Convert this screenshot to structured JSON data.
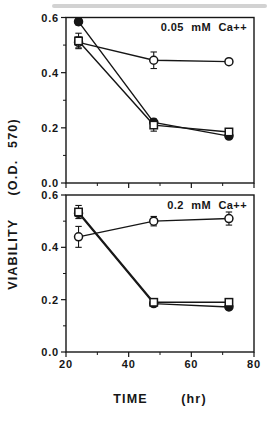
{
  "figure": {
    "background": "#ffffff",
    "ink": "#161616",
    "ylabel": "VIABILITY  (O.D. 570)",
    "xlabel": "TIME  (hr)"
  },
  "chart_data": [
    {
      "type": "line",
      "title": "0.05 mM Ca++",
      "xlabel_visible": false,
      "x": [
        24,
        48,
        72
      ],
      "xlim": [
        20,
        80
      ],
      "ylim": [
        0,
        0.6
      ],
      "yticks": [
        0,
        0.2,
        0.4,
        0.6
      ],
      "yticks_minor": [
        0.1,
        0.3,
        0.5
      ],
      "xticks": [
        20,
        40,
        60,
        80
      ],
      "xticks_minor": [
        30,
        50,
        70
      ],
      "series": [
        {
          "name": "open-circle",
          "marker": "circle",
          "filled": false,
          "values": [
            0.51,
            0.445,
            0.44
          ],
          "errors": [
            0.02,
            0.03,
            0.008
          ]
        },
        {
          "name": "filled-circle",
          "marker": "circle",
          "filled": true,
          "values": [
            0.585,
            0.22,
            0.17
          ],
          "errors": [
            0.012,
            0.008,
            0.008
          ]
        },
        {
          "name": "open-square",
          "marker": "square",
          "filled": false,
          "values": [
            0.515,
            0.21,
            0.185
          ],
          "errors": [
            0.028,
            0.022,
            0.008
          ]
        }
      ]
    },
    {
      "type": "line",
      "title": "0.2 mM Ca++",
      "xlabel_visible": true,
      "x": [
        24,
        48,
        72
      ],
      "xlim": [
        20,
        80
      ],
      "ylim": [
        0,
        0.6
      ],
      "yticks": [
        0,
        0.2,
        0.4,
        0.6
      ],
      "yticks_minor": [
        0.1,
        0.3,
        0.5
      ],
      "xticks": [
        20,
        40,
        60,
        80
      ],
      "xticks_minor": [
        30,
        50,
        70
      ],
      "series": [
        {
          "name": "open-circle",
          "marker": "circle",
          "filled": false,
          "values": [
            0.44,
            0.5,
            0.51
          ],
          "errors": [
            0.04,
            0.018,
            0.025
          ]
        },
        {
          "name": "filled-circle",
          "marker": "circle",
          "filled": true,
          "values": [
            0.53,
            0.185,
            0.172
          ],
          "errors": [
            0.01,
            0.006,
            0.006
          ]
        },
        {
          "name": "open-square",
          "marker": "square",
          "filled": false,
          "values": [
            0.535,
            0.19,
            0.19
          ],
          "errors": [
            0.025,
            0.008,
            0.01
          ]
        }
      ]
    }
  ]
}
